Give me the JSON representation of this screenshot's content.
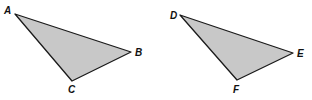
{
  "diagram": {
    "fill_color": "#c8c8c8",
    "stroke_color": "#1a1a1a",
    "triangles": [
      {
        "name": "triangle-abc",
        "points": "15,14 131,52 72,81",
        "labels": [
          {
            "text": "A",
            "x": 4,
            "y": 14
          },
          {
            "text": "B",
            "x": 135,
            "y": 56
          },
          {
            "text": "C",
            "x": 68,
            "y": 93
          }
        ]
      },
      {
        "name": "triangle-def",
        "points": "180,15 293,53 237,80",
        "labels": [
          {
            "text": "D",
            "x": 170,
            "y": 19
          },
          {
            "text": "E",
            "x": 297,
            "y": 57
          },
          {
            "text": "F",
            "x": 233,
            "y": 93
          }
        ]
      }
    ]
  }
}
